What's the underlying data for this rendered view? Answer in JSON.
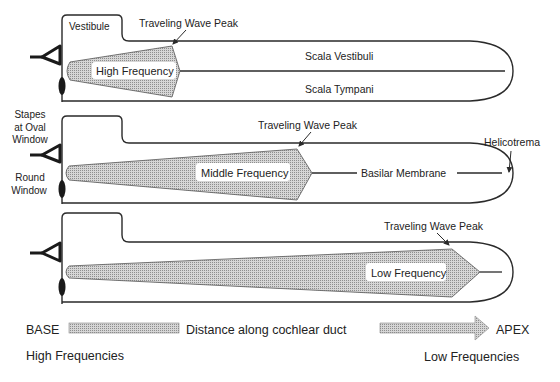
{
  "colors": {
    "line": "#2a2a2a",
    "fill": "#c8c8c8",
    "text": "#222222",
    "label_bg": "#ffffff"
  },
  "panels": [
    {
      "id": "high",
      "vestibule_label": "Vestibule",
      "peak_label": "Traveling Wave Peak",
      "wave_label": "High Frequency",
      "upper_chamber_label": "Scala Vestibuli",
      "lower_chamber_label": "Scala Tympani"
    },
    {
      "id": "middle",
      "stapes_label_line1": "Stapes",
      "stapes_label_line2": "at Oval",
      "stapes_label_line3": "Window",
      "round_window_line1": "Round",
      "round_window_line2": "Window",
      "peak_label": "Traveling Wave Peak",
      "wave_label": "Middle Frequency",
      "membrane_label": "Basilar Membrane",
      "helicotrema_label": "Helicotrema"
    },
    {
      "id": "low",
      "peak_label": "Traveling Wave Peak",
      "wave_label": "Low Frequency"
    }
  ],
  "axis": {
    "base_label": "BASE",
    "middle_label": "Distance along cochlear duct",
    "apex_label": "APEX",
    "base_sub": "High Frequencies",
    "apex_sub": "Low Frequencies"
  }
}
